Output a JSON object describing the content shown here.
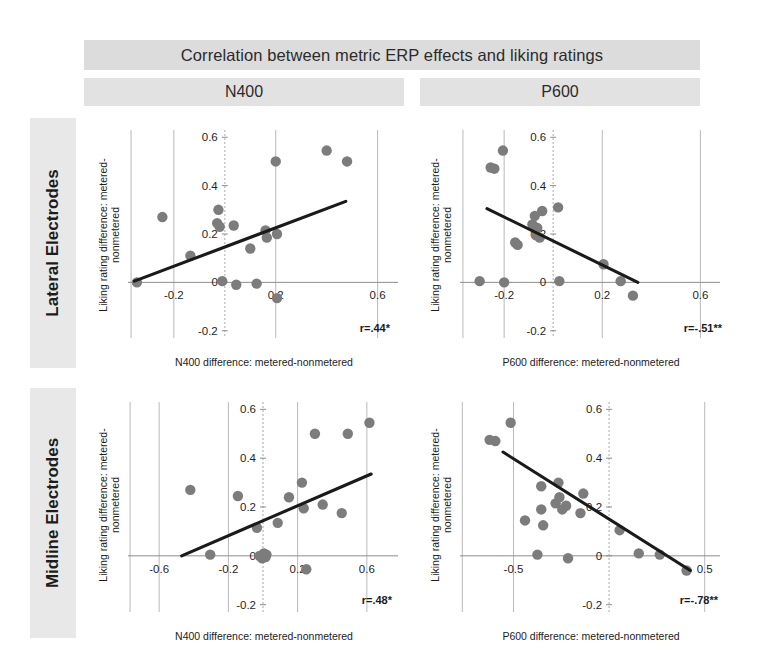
{
  "figure": {
    "title": "Correlation between metric ERP effects and liking ratings",
    "column_headers": [
      {
        "label": "N400"
      },
      {
        "label": "P600"
      }
    ],
    "row_labels": [
      {
        "label": "Lateral Electrodes"
      },
      {
        "label": "Midline Electrodes"
      }
    ],
    "dot_color": "#7c7c7c",
    "line_color": "#1a1a1a",
    "band_color": "#dcdcdc"
  },
  "chart_data": [
    {
      "id": "lateral-n400",
      "type": "scatter",
      "title": "N400",
      "row": "Lateral Electrodes",
      "xlabel": "N400 difference: metered-nonmetered",
      "ylabel": "Liking rating difference: metered-nonmetered",
      "annotation": "r=.44*",
      "r": 0.44,
      "significance": "*",
      "xlim": [
        -0.38,
        0.68
      ],
      "ylim": [
        -0.23,
        0.63
      ],
      "xticks": [
        -0.2,
        0,
        0.2,
        0.6
      ],
      "xticklabels": [
        "-0.2",
        "0",
        "0.2",
        "0.6"
      ],
      "yticks": [
        -0.2,
        0,
        0.2,
        0.4,
        0.6
      ],
      "yticklabels": [
        "-0.2",
        "0",
        "0.2",
        "0.4",
        "0.6"
      ],
      "grid": true,
      "points": [
        {
          "x": -0.345,
          "y": 0.0
        },
        {
          "x": -0.245,
          "y": 0.27
        },
        {
          "x": -0.135,
          "y": 0.11
        },
        {
          "x": -0.03,
          "y": 0.245
        },
        {
          "x": -0.025,
          "y": 0.3
        },
        {
          "x": -0.02,
          "y": 0.23
        },
        {
          "x": -0.01,
          "y": 0.005
        },
        {
          "x": 0.035,
          "y": 0.235
        },
        {
          "x": 0.045,
          "y": -0.01
        },
        {
          "x": 0.1,
          "y": 0.14
        },
        {
          "x": 0.125,
          "y": -0.005
        },
        {
          "x": 0.16,
          "y": 0.215
        },
        {
          "x": 0.165,
          "y": 0.185
        },
        {
          "x": 0.2,
          "y": 0.5
        },
        {
          "x": 0.205,
          "y": 0.2
        },
        {
          "x": 0.205,
          "y": -0.065
        },
        {
          "x": 0.4,
          "y": 0.545
        },
        {
          "x": 0.48,
          "y": 0.5
        }
      ],
      "fit": {
        "x0": -0.355,
        "y0": 0.005,
        "x1": 0.475,
        "y1": 0.335
      }
    },
    {
      "id": "lateral-p600",
      "type": "scatter",
      "title": "P600",
      "row": "Lateral Electrodes",
      "xlabel": "P600  difference: metered-nonmetered",
      "ylabel": "Liking rating difference: metered-nonmetered",
      "annotation": "r=-.51**",
      "r": -0.51,
      "significance": "**",
      "xlim": [
        -0.38,
        0.68
      ],
      "ylim": [
        -0.23,
        0.63
      ],
      "xticks": [
        -0.2,
        0,
        0.2,
        0.6
      ],
      "xticklabels": [
        "-0.2",
        "0",
        "0.2",
        "0.6"
      ],
      "yticks": [
        -0.2,
        0,
        0.2,
        0.4,
        0.6
      ],
      "yticklabels": [
        "-0.2",
        "0",
        "0.2",
        "0.4",
        "0.6"
      ],
      "grid": true,
      "points": [
        {
          "x": -0.3,
          "y": 0.005
        },
        {
          "x": -0.255,
          "y": 0.475
        },
        {
          "x": -0.24,
          "y": 0.47
        },
        {
          "x": -0.205,
          "y": 0.545
        },
        {
          "x": -0.2,
          "y": 0.0
        },
        {
          "x": -0.155,
          "y": 0.165
        },
        {
          "x": -0.145,
          "y": 0.155
        },
        {
          "x": -0.085,
          "y": 0.24
        },
        {
          "x": -0.075,
          "y": 0.275
        },
        {
          "x": -0.07,
          "y": 0.195
        },
        {
          "x": -0.065,
          "y": 0.225
        },
        {
          "x": -0.055,
          "y": 0.185
        },
        {
          "x": -0.045,
          "y": 0.295
        },
        {
          "x": 0.02,
          "y": 0.31
        },
        {
          "x": 0.025,
          "y": 0.005
        },
        {
          "x": 0.205,
          "y": 0.075
        },
        {
          "x": 0.275,
          "y": 0.005
        },
        {
          "x": 0.325,
          "y": -0.055
        }
      ],
      "fit": {
        "x0": -0.27,
        "y0": 0.305,
        "x1": 0.345,
        "y1": 0.0
      }
    },
    {
      "id": "midline-n400",
      "type": "scatter",
      "title": "N400",
      "row": "Midline Electrodes",
      "xlabel": "N400 difference: metered-nonmetered",
      "ylabel": "Liking rating difference: metered-nonmetered",
      "annotation": "r=.48*",
      "r": 0.48,
      "significance": "*",
      "xlim": [
        -0.78,
        0.78
      ],
      "ylim": [
        -0.23,
        0.63
      ],
      "xticks": [
        -0.6,
        -0.2,
        0,
        0.2,
        0.6
      ],
      "xticklabels": [
        "-0.6",
        "-0.2",
        "0",
        "0.2",
        "0.6"
      ],
      "yticks": [
        -0.2,
        0,
        0.2,
        0.4,
        0.6
      ],
      "yticklabels": [
        "-0.2",
        "0",
        "0.2",
        "0.4",
        "0.6"
      ],
      "grid": true,
      "points": [
        {
          "x": -0.42,
          "y": 0.27
        },
        {
          "x": -0.305,
          "y": 0.005
        },
        {
          "x": -0.145,
          "y": 0.245
        },
        {
          "x": -0.035,
          "y": 0.115
        },
        {
          "x": -0.02,
          "y": 0.0
        },
        {
          "x": -0.005,
          "y": -0.01
        },
        {
          "x": 0.005,
          "y": 0.01
        },
        {
          "x": 0.015,
          "y": -0.005
        },
        {
          "x": 0.02,
          "y": 0.005
        },
        {
          "x": 0.085,
          "y": 0.135
        },
        {
          "x": 0.15,
          "y": 0.24
        },
        {
          "x": 0.225,
          "y": 0.3
        },
        {
          "x": 0.235,
          "y": 0.195
        },
        {
          "x": 0.25,
          "y": -0.055
        },
        {
          "x": 0.3,
          "y": 0.5
        },
        {
          "x": 0.345,
          "y": 0.21
        },
        {
          "x": 0.455,
          "y": 0.175
        },
        {
          "x": 0.49,
          "y": 0.5
        },
        {
          "x": 0.615,
          "y": 0.545
        }
      ],
      "fit": {
        "x0": -0.47,
        "y0": 0.0,
        "x1": 0.625,
        "y1": 0.335
      }
    },
    {
      "id": "midline-p600",
      "type": "scatter",
      "title": "P600",
      "row": "Midline Electrodes",
      "xlabel": "P600  difference: metered-nonmetered",
      "ylabel": "Liking rating difference: metered-nonmetered",
      "annotation": "r=-.78**",
      "r": -0.78,
      "significance": "**",
      "xlim": [
        -0.78,
        0.58
      ],
      "ylim": [
        -0.23,
        0.63
      ],
      "xticks": [
        -0.5,
        0,
        0.5
      ],
      "xticklabels": [
        "-0.5",
        "0",
        "0.5"
      ],
      "yticks": [
        -0.2,
        0,
        0.2,
        0.4,
        0.6
      ],
      "yticklabels": [
        "-0.2",
        "0",
        "0.2",
        "0.4",
        "0.6"
      ],
      "grid": true,
      "points": [
        {
          "x": -0.625,
          "y": 0.475
        },
        {
          "x": -0.595,
          "y": 0.47
        },
        {
          "x": -0.515,
          "y": 0.545
        },
        {
          "x": -0.44,
          "y": 0.145
        },
        {
          "x": -0.375,
          "y": 0.005
        },
        {
          "x": -0.355,
          "y": 0.285
        },
        {
          "x": -0.355,
          "y": 0.19
        },
        {
          "x": -0.345,
          "y": 0.125
        },
        {
          "x": -0.28,
          "y": 0.215
        },
        {
          "x": -0.265,
          "y": 0.3
        },
        {
          "x": -0.26,
          "y": 0.24
        },
        {
          "x": -0.245,
          "y": 0.19
        },
        {
          "x": -0.225,
          "y": 0.205
        },
        {
          "x": -0.215,
          "y": -0.01
        },
        {
          "x": -0.15,
          "y": 0.175
        },
        {
          "x": -0.135,
          "y": 0.255
        },
        {
          "x": 0.055,
          "y": 0.105
        },
        {
          "x": 0.155,
          "y": 0.01
        },
        {
          "x": 0.265,
          "y": 0.005
        },
        {
          "x": 0.405,
          "y": -0.06
        }
      ],
      "fit": {
        "x0": -0.555,
        "y0": 0.425,
        "x1": 0.425,
        "y1": -0.06
      }
    }
  ]
}
